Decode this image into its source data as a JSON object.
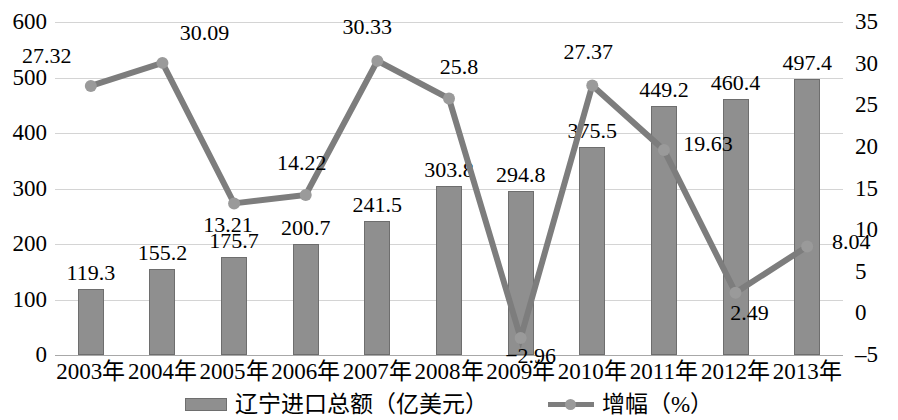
{
  "chart_data": {
    "type": "bar",
    "title": "",
    "subtitle": "",
    "xlabel": "",
    "ylabel": "",
    "grid": true,
    "legend_position": "bottom",
    "categories": [
      "2003年",
      "2004年",
      "2005年",
      "2006年",
      "2007年",
      "2008年",
      "2009年",
      "2010年",
      "2011年",
      "2012年",
      "2013年"
    ],
    "y_left": {
      "label": "",
      "ylim": [
        0,
        600
      ],
      "ticks": [
        "0",
        "100",
        "200",
        "300",
        "400",
        "500",
        "600"
      ],
      "tick_values": [
        0,
        100,
        200,
        300,
        400,
        500,
        600
      ]
    },
    "y_right": {
      "label": "",
      "ylim": [
        -5,
        35
      ],
      "ticks": [
        "-5",
        "0",
        "5",
        "10",
        "15",
        "20",
        "25",
        "30",
        "35"
      ],
      "tick_values": [
        -5,
        0,
        5,
        10,
        15,
        20,
        25,
        30,
        35
      ]
    },
    "series": [
      {
        "name": "辽宁进口总额（亿美元）",
        "type": "bar",
        "axis": "left",
        "color": "#8f8f8f",
        "values": [
          119.3,
          155.2,
          175.7,
          200.7,
          241.5,
          303.8,
          294.8,
          375.5,
          449.2,
          460.4,
          497.4
        ],
        "labels": [
          "119.3",
          "155.2",
          "175.7",
          "200.7",
          "241.5",
          "303.8",
          "294.8",
          "375.5",
          "449.2",
          "460.4",
          "497.4"
        ]
      },
      {
        "name": "增幅（%）",
        "type": "line",
        "axis": "right",
        "color": "#7d7d7d",
        "values": [
          27.32,
          30.09,
          13.21,
          14.22,
          30.33,
          25.8,
          -2.96,
          27.37,
          19.63,
          2.49,
          8.04
        ],
        "labels": [
          "27.32",
          "30.09",
          "13.21",
          "14.22",
          "30.33",
          "25.8",
          "−2.96",
          "27.37",
          "19.63",
          "2.49",
          "8.04"
        ]
      }
    ]
  },
  "legend": {
    "entries": [
      {
        "label": "辽宁进口总额（亿美元）",
        "marker": "bar-swatch"
      },
      {
        "label": "增幅（%）",
        "marker": "line-marker"
      }
    ]
  },
  "colors": {
    "bar_fill": "#8f8f8f",
    "bar_stroke": "#6e6e6e",
    "line": "#7d7d7d",
    "marker": "#9a9a9a",
    "gridline": "#d4d4d4",
    "axis": "#a8a8a8",
    "text": "#000000",
    "background": "#ffffff"
  }
}
